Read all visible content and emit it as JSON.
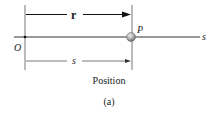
{
  "diagram": {
    "vector_label": "r",
    "point_label": "P",
    "origin_label": "O",
    "axis_label": "s",
    "distance_label": "s",
    "caption": "Position",
    "sub_caption": "(a)"
  }
}
